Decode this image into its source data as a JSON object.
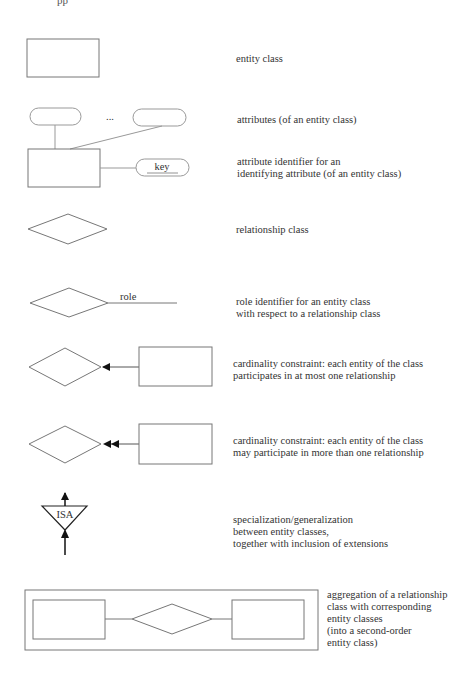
{
  "page_fragment": "pp",
  "legend": [
    {
      "symbol": "entity-class",
      "label": "entity class"
    },
    {
      "symbol": "attributes",
      "label": "attributes (of an entity class)",
      "ellipsis": "..."
    },
    {
      "symbol": "key-attribute",
      "label": "attribute identifier for an\nidentifying attribute (of an entity class)",
      "key_text": "key"
    },
    {
      "symbol": "relationship-class",
      "label": "relationship class"
    },
    {
      "symbol": "role",
      "label": "role identifier for an entity class\nwith respect to a relationship class",
      "role_text": "role"
    },
    {
      "symbol": "cardinality-one",
      "label": "cardinality constraint: each entity of the class\nparticipates in at most one relationship"
    },
    {
      "symbol": "cardinality-many",
      "label": "cardinality constraint: each entity of the class\nmay participate in more than one relationship"
    },
    {
      "symbol": "isa",
      "label": "specialization/generalization\nbetween entity classes,\ntogether with inclusion of extensions",
      "isa_text": "ISA"
    },
    {
      "symbol": "aggregation",
      "label": "aggregation of a relationship\nclass with corresponding\nentity classes\n(into a second-order\nentity class)"
    }
  ],
  "colors": {
    "stroke": "#777777",
    "arrow": "#111111",
    "text": "#333333"
  }
}
